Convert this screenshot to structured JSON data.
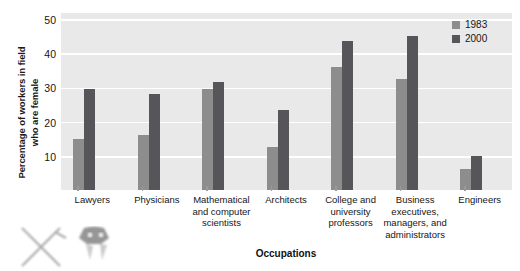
{
  "chart_data": {
    "type": "bar",
    "title": "",
    "xlabel": "Occupations",
    "ylabel": "Percentage of workers in field who are female",
    "ylabel_lines": [
      "Percentage of workers in field",
      "who are female"
    ],
    "ylim": [
      0,
      52
    ],
    "yticks": [
      10,
      20,
      30,
      40,
      50
    ],
    "ytick_labels": [
      "10",
      "20",
      "30",
      "40",
      "50"
    ],
    "grid": true,
    "legend_position": "top-right",
    "categories": [
      "Lawyers",
      "Physicians",
      "Mathematical and computer scientists",
      "Architects",
      "College and university professors",
      "Business executives, managers, and administrators",
      "Engineers"
    ],
    "category_label_lines": [
      [
        "Lawyers"
      ],
      [
        "Physicians"
      ],
      [
        "Mathematical",
        "and computer",
        "scientists"
      ],
      [
        "Architects"
      ],
      [
        "College and",
        "university",
        "professors"
      ],
      [
        "Business",
        "executives,",
        "managers, and",
        "administrators"
      ],
      [
        "Engineers"
      ]
    ],
    "series": [
      {
        "name": "1983",
        "color": "#8d8d8d",
        "values": [
          15,
          16,
          29.5,
          12.5,
          36,
          32.5,
          6
        ]
      },
      {
        "name": "2000",
        "color": "#56565a",
        "values": [
          29.5,
          28,
          31.5,
          23.5,
          43.5,
          45,
          10
        ]
      }
    ]
  },
  "legend": {
    "entries": [
      {
        "label": "1983",
        "color": "#8d8d8d"
      },
      {
        "label": "2000",
        "color": "#56565a"
      }
    ]
  },
  "axes": {
    "x_title": "Occupations",
    "y_title_line1": "Percentage of workers in field",
    "y_title_line2": "who are female"
  },
  "colors": {
    "plot_background": "#e9e9e9",
    "gridline": "#ffffff",
    "series_1983": "#8d8d8d",
    "series_2000": "#56565a",
    "text": "#161616",
    "page_background": "#ffffff"
  }
}
